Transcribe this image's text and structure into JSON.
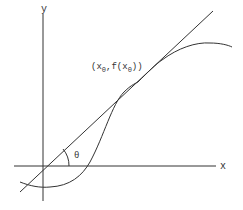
{
  "diagram": {
    "title": "",
    "axes": {
      "x_label": "x",
      "y_label": "y"
    },
    "point_label": {
      "open": "(x",
      "sub1": "0",
      "mid": ",f(x",
      "sub2": "0",
      "close": "))"
    },
    "angle_label": "θ",
    "elements": [
      "x-axis",
      "y-axis",
      "curve f(x)",
      "tangent line at (x0, f(x0))",
      "angle θ between tangent and x-axis"
    ],
    "colors": {
      "stroke": "#333333",
      "background": "#ffffff"
    }
  }
}
